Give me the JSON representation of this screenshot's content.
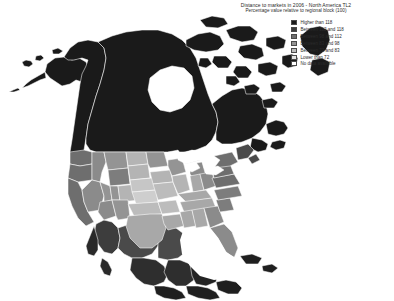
{
  "figure": {
    "title": "Distance to markets in 2006 - North America TL2",
    "subtitle": "Percentage value relative to regional block (100)"
  },
  "legend": {
    "items": [
      {
        "label": "Higher than 118",
        "color": "#1a1a1a"
      },
      {
        "label": "Between 112 and 118",
        "color": "#3d3d3d"
      },
      {
        "label": "Between 98 and 112",
        "color": "#6e6e6e"
      },
      {
        "label": "Between 83 and 98",
        "color": "#949494"
      },
      {
        "label": "Between 72 and 83",
        "color": "#bcbcbc"
      },
      {
        "label": "Lower than 72",
        "color": "#e2e2e2"
      },
      {
        "label": "No data available",
        "color": "#ffffff"
      }
    ]
  },
  "chart_data": {
    "type": "map",
    "map_kind": "choropleth",
    "region": "North America",
    "geo_level": "TL2 (sub-national regions)",
    "title": "Distance to markets in 2006 - North America TL2",
    "subtitle": "Percentage value relative to regional block (100)",
    "unit": "percentage of regional block average (=100)",
    "legend_position": "top-right",
    "bins": [
      {
        "label": "Higher than 118",
        "min": 118,
        "max": null,
        "color": "#1a1a1a"
      },
      {
        "label": "Between 112 and 118",
        "min": 112,
        "max": 118,
        "color": "#3d3d3d"
      },
      {
        "label": "Between 98 and 112",
        "min": 98,
        "max": 112,
        "color": "#6e6e6e"
      },
      {
        "label": "Between 83 and 98",
        "min": 83,
        "max": 98,
        "color": "#949494"
      },
      {
        "label": "Between 72 and 83",
        "min": 72,
        "max": 83,
        "color": "#bcbcbc"
      },
      {
        "label": "Lower than 72",
        "min": null,
        "max": 72,
        "color": "#e2e2e2"
      },
      {
        "label": "No data available",
        "min": null,
        "max": null,
        "color": "#ffffff"
      }
    ],
    "countries": [
      {
        "name": "Canada",
        "predominant_bin": "Higher than 118"
      },
      {
        "name": "United States",
        "predominant_bin": "Between 83 and 98"
      },
      {
        "name": "Mexico",
        "predominant_bin": "Between 112 and 118"
      }
    ]
  }
}
